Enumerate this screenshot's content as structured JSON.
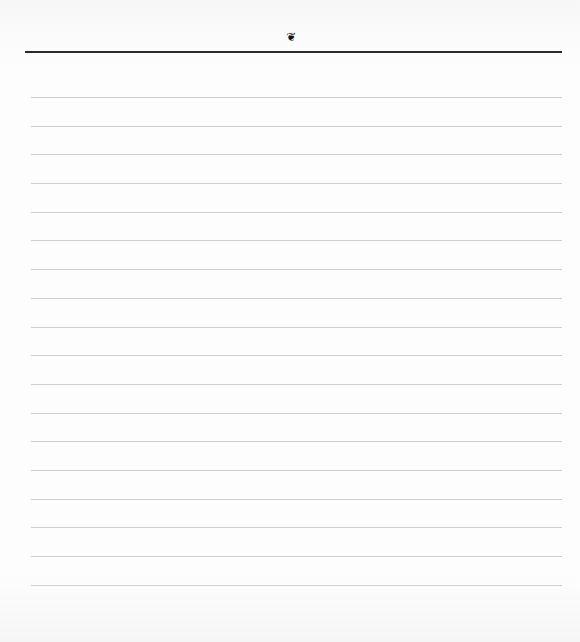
{
  "page": {
    "ornament": {
      "icon": "fleuron-icon",
      "glyph": "❦"
    },
    "header_rule_color": "#2a2a2a",
    "rule_color": "#cfcfcf",
    "ruled_lines_y": [
      97,
      126,
      154,
      183,
      212,
      240,
      269,
      298,
      327,
      355,
      384,
      413,
      441,
      470,
      499,
      527,
      556,
      585
    ]
  }
}
